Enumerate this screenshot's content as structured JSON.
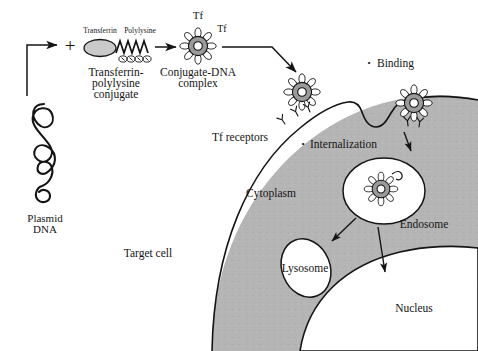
{
  "figure": {
    "background_color": "#ffffff",
    "ink_color": "#141414",
    "cytoplasm_fill": "#b5b5b5",
    "complex_fill": "#9a9a9a",
    "organelle_fill": "#ffffff"
  },
  "labels": {
    "plasmid_dna_line1": "Plasmid",
    "plasmid_dna_line2": "DNA",
    "plus_sign": "+",
    "transferrin_top": "Transferrin",
    "polylysine_top": "Polylysine",
    "conjugate_line1": "Transferrin-",
    "conjugate_line2": "polylysine",
    "conjugate_line3": "conjugate",
    "tf_top": "Tf",
    "tf_right": "Tf",
    "complex_line1": "Conjugate-DNA",
    "complex_line2": "complex",
    "binding": "Binding",
    "tf_receptors": "Tf receptors",
    "internalization": "Internalization",
    "target_cell": "Target cell",
    "cytoplasm": "Cytoplasm",
    "endosome": "Endosome",
    "lysosome": "Lysosome",
    "nucleus": "Nucleus",
    "bullet": "•"
  }
}
